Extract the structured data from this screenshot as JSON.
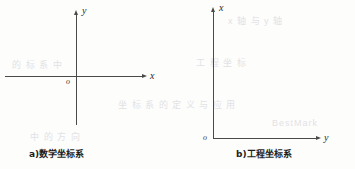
{
  "figure": {
    "panels": [
      {
        "id": "a",
        "caption": "a)数学坐标系",
        "axes": [
          {
            "name": "horizontal",
            "label": "x"
          },
          {
            "name": "vertical",
            "label": "y"
          }
        ],
        "origin_label": "o"
      },
      {
        "id": "b",
        "caption": "b)工程坐标系",
        "axes": [
          {
            "name": "vertical",
            "label": "x"
          },
          {
            "name": "horizontal",
            "label": "y"
          }
        ],
        "origin_label": "o"
      }
    ]
  },
  "colors": {
    "axis": "#4a4a4a",
    "text": "#1e1e1e",
    "background": "#fdfdfc",
    "bleed": "#d9d9dd"
  },
  "artifacts": {
    "bleed_text": [
      "的 标 系 中",
      "工 程 坐 标",
      "BestMark",
      "坐 标 系 的 定 义 与 应 用",
      "x 轴 与 y 轴",
      "中 的 方 向"
    ]
  }
}
